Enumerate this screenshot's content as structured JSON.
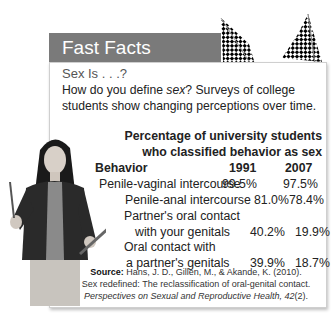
{
  "box": {
    "title": "Fast Facts",
    "subtitle": "Sex Is . . .?",
    "intro_prefix": "How do you define ",
    "intro_em": "sex",
    "intro_suffix": "? Surveys of college students show changing perceptions over time."
  },
  "table": {
    "title_line1": "Percentage of university students",
    "title_line2": "who classified behavior as sex",
    "columns": [
      "Behavior",
      "1991",
      "2007"
    ],
    "rows": [
      {
        "behavior": "Penile-vaginal intercourse",
        "y1991": "99.5%",
        "y2007": "97.5%"
      },
      {
        "behavior": "Penile-anal intercourse",
        "y1991": "81.0%",
        "y2007": "78.4%"
      },
      {
        "behavior_line1": "Partner's oral contact",
        "behavior_line2": "with your genitals",
        "y1991": "40.2%",
        "y2007": "19.9%"
      },
      {
        "behavior_line1": "Oral contact with",
        "behavior_line2": "a partner's genitals",
        "y1991": "39.9%",
        "y2007": "18.7%"
      }
    ]
  },
  "source": {
    "label": "Source:",
    "line1": " Hans, J. D., Gillen, M., & Akande, K. (2010).",
    "line2": "Sex redefined: The reclassification of oral-genital contact.",
    "line3_italic": "Perspectives on Sexual and Reproductive Health, 42",
    "line3_tail": "(2)."
  },
  "colors": {
    "header_bg": "#7a7a7a",
    "header_text": "#ffffff"
  }
}
